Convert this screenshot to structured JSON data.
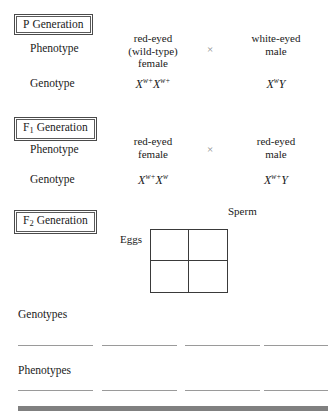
{
  "page": {
    "background_color": "#ffffff",
    "text_color": "#1a1a1a"
  },
  "sections": {
    "p_generation": {
      "box_label_main": "P",
      "box_label_sub": "",
      "box_label_word": "Generation",
      "phenotype_row_label": "Phenotype",
      "genotype_row_label": "Genotype",
      "cross_symbol": "×",
      "left": {
        "phenotype_line1": "red-eyed",
        "phenotype_line2": "(wild-type)",
        "phenotype_line3": "female",
        "genotype_allele1_base": "X",
        "genotype_allele1_sup": "w+",
        "genotype_allele2_base": "X",
        "genotype_allele2_sup": "w+"
      },
      "right": {
        "phenotype_line1": "white-eyed",
        "phenotype_line2": "male",
        "phenotype_line3": "",
        "genotype_allele1_base": "X",
        "genotype_allele1_sup": "w",
        "genotype_allele2_base": "Y",
        "genotype_allele2_sup": ""
      }
    },
    "f1_generation": {
      "box_label_main": "F",
      "box_label_sub": "1",
      "box_label_word": "Generation",
      "phenotype_row_label": "Phenotype",
      "genotype_row_label": "Genotype",
      "cross_symbol": "×",
      "left": {
        "phenotype_line1": "red-eyed",
        "phenotype_line2": "female",
        "phenotype_line3": "",
        "genotype_allele1_base": "X",
        "genotype_allele1_sup": "w+",
        "genotype_allele2_base": "X",
        "genotype_allele2_sup": "w"
      },
      "right": {
        "phenotype_line1": "red-eyed",
        "phenotype_line2": "male",
        "phenotype_line3": "",
        "genotype_allele1_base": "X",
        "genotype_allele1_sup": "w+",
        "genotype_allele2_base": "Y",
        "genotype_allele2_sup": ""
      }
    },
    "f2_generation": {
      "box_label_main": "F",
      "box_label_sub": "2",
      "box_label_word": "Generation",
      "sperm_label": "Sperm",
      "eggs_label": "Eggs",
      "punnett_cells": [
        "",
        "",
        "",
        ""
      ],
      "genotypes_label": "Genotypes",
      "phenotypes_label": "Phenotypes",
      "genotype_blanks": [
        "",
        "",
        "",
        ""
      ],
      "phenotype_blanks": [
        "",
        "",
        "",
        ""
      ]
    }
  }
}
